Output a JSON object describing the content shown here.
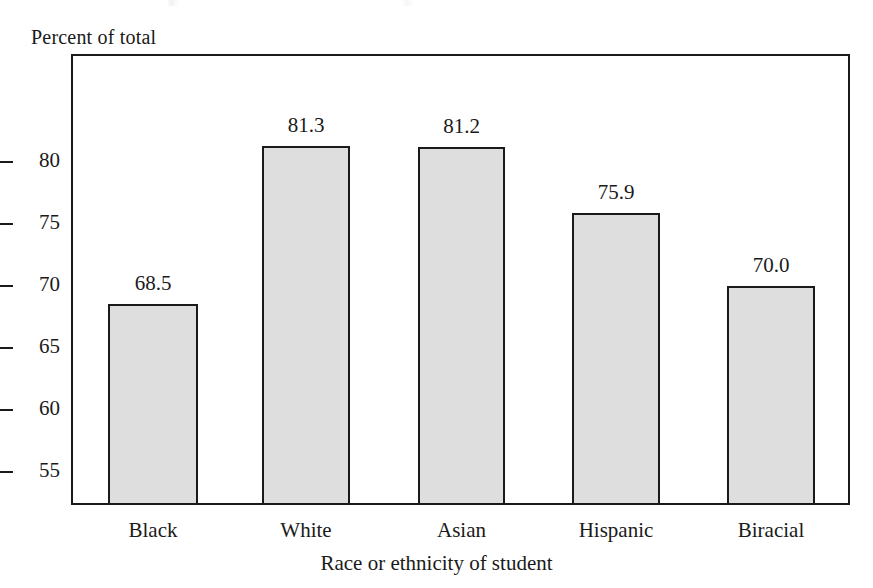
{
  "chart_data": {
    "type": "bar",
    "title": "",
    "subtitle": "",
    "xlabel": "Race or ethnicity of student",
    "ylabel": "Percent of total",
    "categories": [
      "Black",
      "White",
      "Asian",
      "Hispanic",
      "Biracial"
    ],
    "values": [
      68.5,
      81.3,
      81.2,
      75.9,
      70.0
    ],
    "value_labels": [
      "68.5",
      "81.3",
      "81.2",
      "75.9",
      "70.0"
    ],
    "ylim": [
      52.3,
      88.7
    ],
    "yticks": [
      80,
      75,
      70,
      65,
      60,
      55
    ],
    "ytick_labels": [
      "80",
      "75",
      "70",
      "65",
      "60",
      "55"
    ],
    "grid": false,
    "legend": null,
    "bar_fill_color": "#dedede",
    "bar_edge_color": "#1a1a1a",
    "axis_color": "#1a1a1a",
    "background_color": "#ffffff"
  }
}
